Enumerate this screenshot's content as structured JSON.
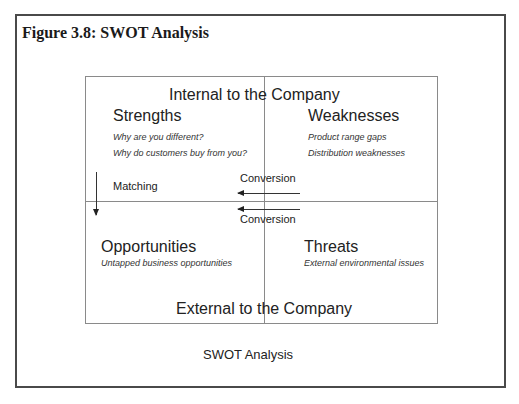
{
  "figure": {
    "title": "Figure 3.8: SWOT Analysis",
    "caption": "SWOT Analysis"
  },
  "diagram": {
    "top_header": "Internal to the Company",
    "bottom_header": "External to the Company",
    "quadrants": {
      "strengths": {
        "title": "Strengths",
        "items": [
          "Why are you different?",
          "Why do customers buy from you?"
        ]
      },
      "weaknesses": {
        "title": "Weaknesses",
        "items": [
          "Product range gaps",
          "Distribution weaknesses"
        ]
      },
      "opportunities": {
        "title": "Opportunities",
        "items": [
          "Untapped business opportunities"
        ]
      },
      "threats": {
        "title": "Threats",
        "items": [
          "External environmental issues"
        ]
      }
    },
    "arrows": {
      "matching_label": "Matching",
      "conversion_top_label": "Conversion",
      "conversion_bottom_label": "Conversion"
    },
    "colors": {
      "frame": "#4a4a4a",
      "grid": "#8a8a8a",
      "text": "#222222"
    }
  }
}
